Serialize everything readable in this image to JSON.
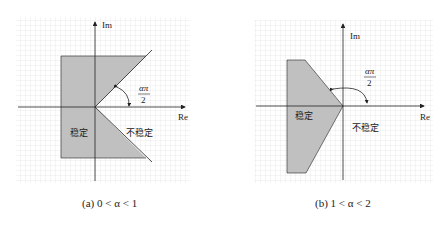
{
  "panels": [
    {
      "id": "a",
      "caption": "(a) 0 < α < 1",
      "axis_x_label": "Re",
      "axis_y_label": "Im",
      "angle_label_num": "απ",
      "angle_label_den": "2",
      "stable_label": "稳定",
      "unstable_label": "不稳定"
    },
    {
      "id": "b",
      "caption": "(b) 1 < α < 2",
      "axis_x_label": "Re",
      "axis_y_label": "Im",
      "angle_label_num": "απ",
      "angle_label_den": "2",
      "stable_label": "稳定",
      "unstable_label": "不稳定"
    }
  ],
  "colors": {
    "fill": "#c0c0c0",
    "grid": "#d8d8d8",
    "axis": "#222222"
  }
}
